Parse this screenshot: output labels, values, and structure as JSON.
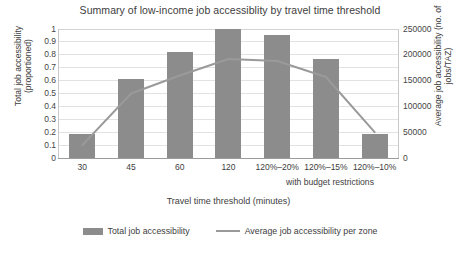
{
  "chart_data": {
    "type": "bar",
    "title": "Summary of low-income job accessiblity by travel time threshold",
    "xlabel": "Travel time threshold (minutes)",
    "ylabel": "Total job accessibility (proportioned)",
    "y2label": "Average job accessibility (no. of jobs/TAZ)",
    "categories": [
      "30",
      "45",
      "60",
      "120",
      "120%–20%",
      "120%–15%",
      "120%–10%"
    ],
    "note": "with budget restrictions",
    "ylim": [
      0,
      1
    ],
    "y2lim": [
      0,
      250000
    ],
    "yticks": [
      "0",
      "0.1",
      "0.2",
      "0.3",
      "0.4",
      "0.5",
      "0.6",
      "0.7",
      "0.8",
      "0.9",
      "1"
    ],
    "y2ticks": [
      "0",
      "50000",
      "100000",
      "150000",
      "200000",
      "250000"
    ],
    "grid": true,
    "legend_position": "bottom",
    "series": [
      {
        "name": "Total job accessibility",
        "type": "bar",
        "axis": "left",
        "color": "#8c8c8c",
        "values": [
          0.19,
          0.61,
          0.82,
          1.0,
          0.95,
          0.77,
          0.19
        ]
      },
      {
        "name": "Average job accessibility per zone",
        "type": "line",
        "axis": "right",
        "color": "#9a9a9a",
        "values": [
          25000,
          125000,
          160000,
          192000,
          188000,
          157000,
          50000
        ]
      }
    ]
  },
  "legend": {
    "bar_label": "Total job accessibility",
    "line_label": "Average job accessibility per zone"
  }
}
